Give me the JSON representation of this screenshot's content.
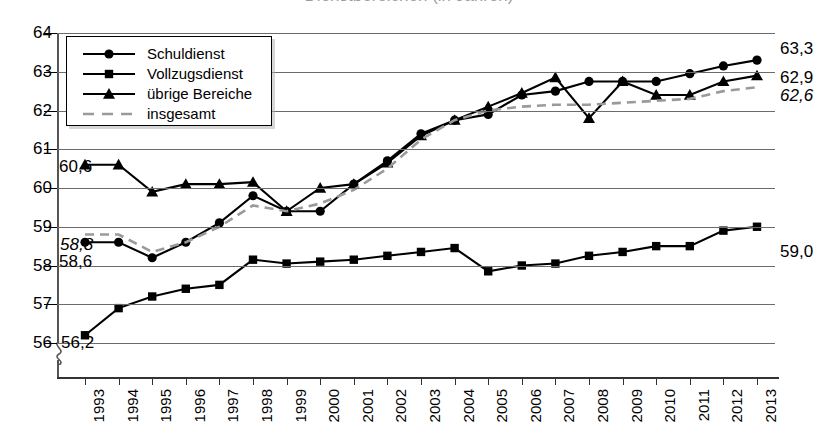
{
  "chart": {
    "title": "Dienstbereichen (in Jahren)",
    "ylabel": "",
    "xlabel": ""
  },
  "legend": {
    "items": [
      {
        "label": "Schuldienst",
        "marker": "circle",
        "color": "#000000"
      },
      {
        "label": "Vollzugsdienst",
        "marker": "square",
        "color": "#000000"
      },
      {
        "label": "übrige Bereiche",
        "marker": "triangle",
        "color": "#000000"
      },
      {
        "label": "insgesamt",
        "marker": "dashed-line",
        "color": "#9a9a9a"
      }
    ]
  },
  "yaxis": {
    "ticks": [
      "64",
      "63",
      "62",
      "61",
      "60",
      "59",
      "58",
      "57",
      "56"
    ],
    "min": 56,
    "max": 64,
    "broken": true
  },
  "annotations": {
    "left": [
      {
        "text": "60,6",
        "series": "übrige Bereiche"
      },
      {
        "text": "58,8",
        "series": "insgesamt"
      },
      {
        "text": "58,6",
        "series": "Schuldienst"
      },
      {
        "text": "56,2",
        "series": "Vollzugsdienst"
      }
    ],
    "right": [
      {
        "text": "63,3",
        "series": "Schuldienst"
      },
      {
        "text": "62,9",
        "series": "übrige Bereiche"
      },
      {
        "text": "62,6",
        "series": "insgesamt"
      },
      {
        "text": "59,0",
        "series": "Vollzugsdienst"
      }
    ]
  },
  "chart_data": {
    "type": "line",
    "title": "Dienstbereichen (in Jahren)",
    "xlabel": "",
    "ylabel": "",
    "ylim": [
      56,
      64
    ],
    "grid": true,
    "legend_position": "top-left",
    "categories": [
      "1993",
      "1994",
      "1995",
      "1996",
      "1997",
      "1998",
      "1999",
      "2000",
      "2001",
      "2002",
      "2003",
      "2004",
      "2005",
      "2006",
      "2007",
      "2008",
      "2009",
      "2010",
      "2011",
      "2012",
      "2013"
    ],
    "series": [
      {
        "name": "Schuldienst",
        "marker": "circle",
        "color": "#000000",
        "values": [
          58.6,
          58.6,
          58.2,
          58.6,
          59.1,
          59.8,
          59.4,
          59.4,
          60.1,
          60.7,
          61.4,
          61.75,
          61.9,
          62.4,
          62.5,
          62.75,
          62.75,
          62.75,
          62.95,
          63.15,
          63.3
        ]
      },
      {
        "name": "Vollzugsdienst",
        "marker": "square",
        "color": "#000000",
        "values": [
          56.2,
          56.9,
          57.2,
          57.4,
          57.5,
          58.15,
          58.05,
          58.1,
          58.15,
          58.25,
          58.35,
          58.45,
          57.85,
          58.0,
          58.05,
          58.25,
          58.35,
          58.5,
          58.5,
          58.9,
          59.0
        ]
      },
      {
        "name": "übrige Bereiche",
        "marker": "triangle",
        "color": "#000000",
        "values": [
          60.6,
          60.6,
          59.9,
          60.1,
          60.1,
          60.15,
          59.4,
          60.0,
          60.1,
          60.65,
          61.35,
          61.75,
          62.1,
          62.45,
          62.85,
          61.8,
          62.75,
          62.4,
          62.4,
          62.75,
          62.9
        ]
      },
      {
        "name": "insgesamt",
        "marker": "dashed-line",
        "color": "#9a9a9a",
        "values": [
          58.8,
          58.8,
          58.35,
          58.6,
          59.0,
          59.55,
          59.4,
          59.6,
          59.95,
          60.5,
          61.25,
          61.75,
          62.0,
          62.1,
          62.15,
          62.15,
          62.2,
          62.25,
          62.3,
          62.5,
          62.6
        ]
      }
    ]
  }
}
